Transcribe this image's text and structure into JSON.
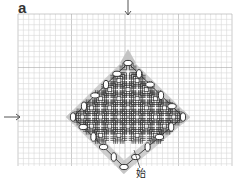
{
  "figure": {
    "panel_label": "a",
    "start_label": "始",
    "width": 245,
    "height": 184
  },
  "grid": {
    "x0": 18,
    "y0": 14,
    "x1": 232,
    "y1": 166,
    "cell": 5.35,
    "minor_color": "#d6d6d6",
    "major_every": 10,
    "major_color": "#a8a8a8"
  },
  "pattern": {
    "center": [
      128,
      117
    ],
    "motif_step": 18.3,
    "rows": [
      {
        "r": -5,
        "cols": [
          0
        ]
      },
      {
        "r": -4,
        "cols": [
          -1,
          1
        ]
      },
      {
        "r": -3,
        "cols": [
          -2,
          0,
          2
        ]
      },
      {
        "r": -2,
        "cols": [
          -3,
          -1,
          1,
          3
        ]
      },
      {
        "r": -1,
        "cols": [
          -4,
          -2,
          0,
          2,
          4
        ]
      },
      {
        "r": 0,
        "cols": [
          -5,
          -3,
          -1,
          1,
          3,
          5
        ]
      },
      {
        "r": 1,
        "cols": [
          -4,
          -2,
          0,
          2,
          4
        ]
      },
      {
        "r": 2,
        "cols": [
          -3,
          -1,
          1,
          3
        ]
      }
    ],
    "line_color": "#3a3a3a",
    "shade_color": "#c4c4c4"
  },
  "ovals": {
    "stroke": "#222222",
    "fill": "#ffffff",
    "diamond": {
      "top": [
        128,
        63
      ],
      "right": [
        183,
        117
      ],
      "bottom": [
        124,
        167
      ],
      "left": [
        73,
        117
      ]
    },
    "per_side": 5
  },
  "arrows": [
    {
      "name": "top-entry-arrow",
      "from": [
        128,
        0
      ],
      "to": [
        128,
        15
      ],
      "color": "#555555"
    },
    {
      "name": "left-entry-arrow",
      "from": [
        4,
        117
      ],
      "to": [
        20,
        117
      ],
      "color": "#555555"
    }
  ],
  "leader": {
    "from": [
      140,
      168
    ],
    "to": [
      134,
      150
    ]
  }
}
